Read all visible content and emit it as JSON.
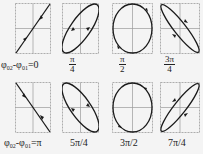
{
  "figure": {
    "colors": {
      "background": "#f4f4f4",
      "curve": "#1a1a1a",
      "grid": "#9a9a9a"
    },
    "panels": [
      {
        "id": "p0",
        "row": 0,
        "col": 0,
        "shape": "line",
        "slope": "positive",
        "label_type": "phase",
        "label_prefix": "φ",
        "sub1": "02",
        "mid": "-φ",
        "sub2": "01",
        "suffix": "=0"
      },
      {
        "id": "p1",
        "row": 0,
        "col": 1,
        "shape": "ellipse",
        "tilt": "positive",
        "aspect": "narrow",
        "label_type": "frac",
        "num": "π",
        "den": "4"
      },
      {
        "id": "p2",
        "row": 0,
        "col": 2,
        "shape": "circle",
        "label_type": "frac",
        "num": "π",
        "den": "2"
      },
      {
        "id": "p3",
        "row": 0,
        "col": 3,
        "shape": "ellipse",
        "tilt": "negative",
        "aspect": "narrow",
        "label_type": "frac",
        "num": "3π",
        "den": "4"
      },
      {
        "id": "p4",
        "row": 1,
        "col": 0,
        "shape": "line",
        "slope": "negative",
        "label_type": "phase",
        "label_prefix": "φ",
        "sub1": "02",
        "mid": "-φ",
        "sub2": "01",
        "suffix": "=π"
      },
      {
        "id": "p5",
        "row": 1,
        "col": 1,
        "shape": "ellipse",
        "tilt": "negative",
        "aspect": "narrow",
        "label_type": "text",
        "text": "5π/4"
      },
      {
        "id": "p6",
        "row": 1,
        "col": 2,
        "shape": "circle",
        "label_type": "text",
        "text": "3π/2"
      },
      {
        "id": "p7",
        "row": 1,
        "col": 3,
        "shape": "ellipse",
        "tilt": "positive",
        "aspect": "narrow",
        "label_type": "text",
        "text": "7π/4"
      }
    ]
  },
  "labels": {
    "p0": {
      "prefix": "φ",
      "sub1": "02",
      "mid": "-φ",
      "sub2": "01",
      "suffix": "=0"
    },
    "p1": {
      "num": "π",
      "den": "4"
    },
    "p2": {
      "num": "π",
      "den": "2"
    },
    "p3": {
      "num": "3π",
      "den": "4"
    },
    "p4": {
      "prefix": "φ",
      "sub1": "02",
      "mid": "-φ",
      "sub2": "01",
      "suffix": "=π"
    },
    "p5": {
      "text": "5π/4"
    },
    "p6": {
      "text": "3π/2"
    },
    "p7": {
      "text": "7π/4"
    }
  }
}
